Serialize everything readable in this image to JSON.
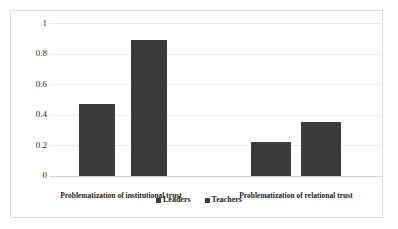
{
  "chart_data": {
    "type": "bar",
    "title": "",
    "subtitle": "",
    "xlabel": "",
    "ylabel": "",
    "categories": [
      "Problematization of institutional trust",
      "Problematization of relational trust"
    ],
    "series": [
      {
        "name": "Leaders",
        "values": [
          0.47,
          0.22
        ],
        "color": "#3c3c3c"
      },
      {
        "name": "Teachers",
        "values": [
          0.89,
          0.35
        ],
        "color": "#3c3c3c"
      }
    ],
    "ylim": [
      0,
      1
    ],
    "yticks": [
      0,
      0.2,
      0.4,
      0.6,
      0.8,
      1
    ],
    "ytick_labels": [
      "0",
      "0.2",
      "0.4",
      "0.6",
      "0.8",
      "1"
    ],
    "grid": true,
    "grid_axis": "y",
    "legend_position": "bottom-center",
    "annotations": [],
    "bar_color": "#3c3c3c",
    "gridline_color": "#e8e8e8",
    "frame_border_color": "#d9d9d9",
    "background_color": "#ffffff"
  },
  "legend": {
    "entries": [
      {
        "label": "Leaders",
        "marker": "square-marker"
      },
      {
        "label": "Teachers",
        "marker": "square-marker"
      }
    ]
  }
}
